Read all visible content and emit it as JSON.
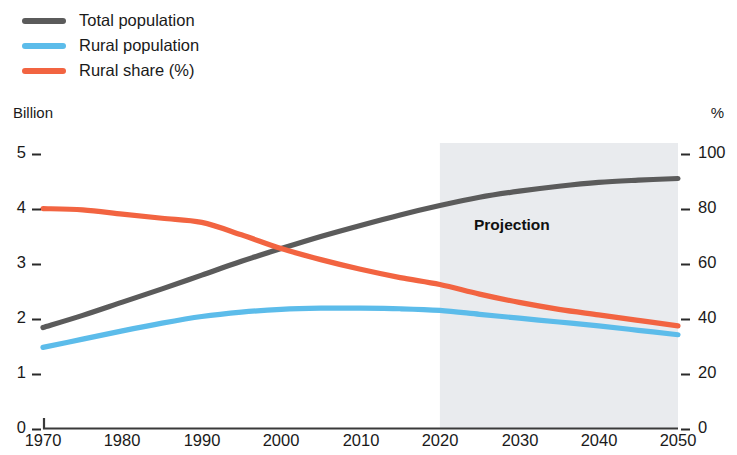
{
  "legend": {
    "position": "top-left",
    "items": [
      {
        "label": "Total population",
        "color": "#5b5b5b",
        "icon": "line-swatch-icon"
      },
      {
        "label": "Rural population",
        "color": "#5cbcea",
        "icon": "line-swatch-icon"
      },
      {
        "label": "Rural share (%)",
        "color": "#f26441",
        "icon": "line-swatch-icon"
      }
    ]
  },
  "axes": {
    "left_unit": "Billion",
    "right_unit": "%",
    "left_ticks": [
      "5",
      "4",
      "3",
      "2",
      "1",
      "0"
    ],
    "right_ticks": [
      "100",
      "80",
      "60",
      "40",
      "20",
      "0"
    ],
    "x_ticks": [
      "1970",
      "1980",
      "1990",
      "2000",
      "2010",
      "2020",
      "2030",
      "2040",
      "2050"
    ]
  },
  "annotations": {
    "projection_label": "Projection",
    "projection_start_year": 2020,
    "projection_band_color": "#e9ebee"
  },
  "chart_data": {
    "type": "line",
    "title": "",
    "subtitle": "",
    "xlabel": "",
    "ylabel": "Billion",
    "y2label": "%",
    "xlim": [
      1970,
      2050
    ],
    "ylim": [
      0,
      5
    ],
    "y2lim": [
      0,
      100
    ],
    "grid": false,
    "legend_position": "top-left",
    "x": [
      1970,
      1975,
      1980,
      1985,
      1990,
      1995,
      2000,
      2005,
      2010,
      2015,
      2020,
      2025,
      2030,
      2035,
      2040,
      2045,
      2050
    ],
    "series": [
      {
        "name": "Total population",
        "color": "#5b5b5b",
        "axis": "left",
        "unit": "Billion",
        "values": [
          1.82,
          2.04,
          2.28,
          2.52,
          2.77,
          3.02,
          3.25,
          3.47,
          3.67,
          3.86,
          4.03,
          4.18,
          4.29,
          4.38,
          4.45,
          4.49,
          4.52
        ]
      },
      {
        "name": "Rural population",
        "color": "#5cbcea",
        "axis": "left",
        "unit": "Billion",
        "values": [
          1.46,
          1.61,
          1.76,
          1.9,
          2.02,
          2.1,
          2.15,
          2.17,
          2.17,
          2.16,
          2.13,
          2.06,
          1.99,
          1.92,
          1.85,
          1.77,
          1.69
        ]
      },
      {
        "name": "Rural share (%)",
        "color": "#f26441",
        "axis": "right",
        "unit": "%",
        "values": [
          79.5,
          79.0,
          77.5,
          76.0,
          74.5,
          70.0,
          65.0,
          61.0,
          57.5,
          54.5,
          52.0,
          48.5,
          45.5,
          43.0,
          41.0,
          39.0,
          37.0
        ]
      }
    ],
    "annotations": [
      {
        "text": "Projection",
        "x": 2022,
        "type": "region-label"
      }
    ],
    "shaded_regions": [
      {
        "from": 2020,
        "to": 2050,
        "label": "Projection",
        "color": "#e9ebee"
      }
    ]
  }
}
